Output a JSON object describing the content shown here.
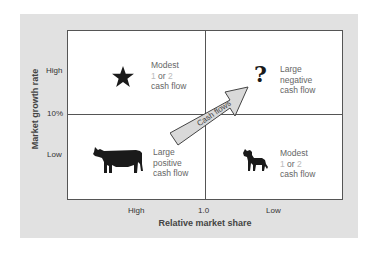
{
  "diagram": {
    "y_axis": {
      "title": "Market growth rate",
      "ticks": [
        "High",
        "10%",
        "Low"
      ]
    },
    "x_axis": {
      "title": "Relative market share",
      "ticks": [
        "High",
        "1.0",
        "Low"
      ]
    },
    "quadrants": [
      {
        "position": "top-left",
        "icon": "star-icon",
        "lines": [
          "Modest",
          "1",
          "or",
          "2",
          "cash flow"
        ]
      },
      {
        "position": "top-right",
        "icon": "question-mark-icon",
        "icon_glyph": "?",
        "lines": [
          "Large",
          "negative",
          "cash flow"
        ]
      },
      {
        "position": "bottom-left",
        "icon": "cow-icon",
        "lines": [
          "Large",
          "positive",
          "cash flow"
        ]
      },
      {
        "position": "bottom-right",
        "icon": "dog-icon",
        "lines": [
          "Modest",
          "1",
          "or",
          "2",
          "cash flow"
        ]
      }
    ],
    "arrow": {
      "label": "Cash flows",
      "from": "bottom-left",
      "to": "top-right"
    }
  },
  "colors": {
    "panel_bg": "#e1e1e1",
    "box_bg": "#ffffff",
    "lines": "#555555",
    "arrow_fill": "#d9d9d9",
    "icon_fill": "#1a1a1a",
    "muted_number": "#bbbbbb"
  }
}
